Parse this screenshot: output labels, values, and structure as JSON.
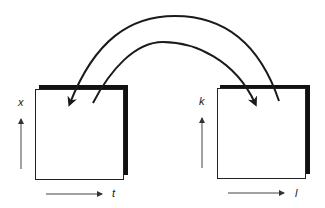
{
  "diagram": {
    "type": "transform-pair",
    "left_panel": {
      "vertical_axis_label": "x",
      "horizontal_axis_label": "t"
    },
    "right_panel": {
      "vertical_axis_label": "k",
      "horizontal_axis_label": "l"
    },
    "arrows": [
      {
        "from": "right_panel",
        "to": "left_panel",
        "shape": "outer-arc"
      },
      {
        "from": "left_panel",
        "to": "right_panel",
        "shape": "inner-arc"
      }
    ],
    "colors": {
      "ink": "#1a1a1a",
      "shadow": "#111111",
      "background": "#ffffff"
    }
  }
}
